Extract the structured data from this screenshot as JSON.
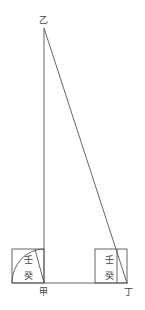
{
  "diagram": {
    "points": {
      "top": "乙",
      "bottom_left": "甲",
      "bottom_right": "丁"
    },
    "left_box": {
      "upper": "壬",
      "lower": "癸"
    },
    "right_box": {
      "upper": "壬",
      "lower": "癸"
    },
    "stroke_color": "#555555"
  }
}
